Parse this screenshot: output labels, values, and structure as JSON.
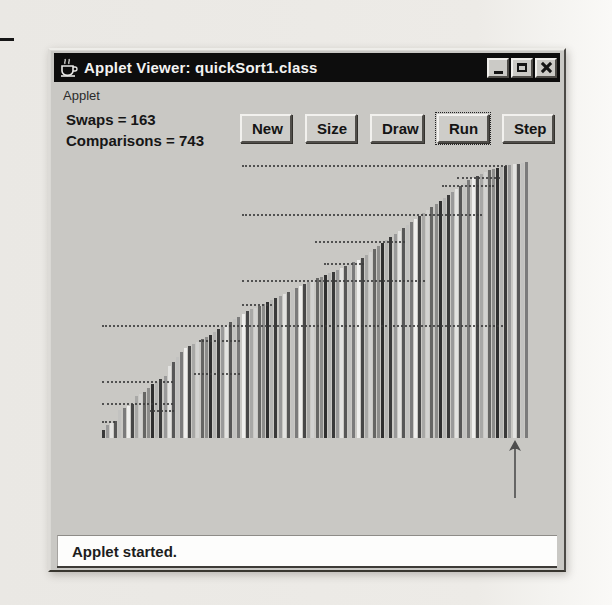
{
  "window": {
    "title": "Applet Viewer: quickSort1.class",
    "menu": {
      "applet_label": "Applet"
    },
    "controls": [
      {
        "name": "minimize"
      },
      {
        "name": "maximize"
      },
      {
        "name": "close"
      }
    ]
  },
  "stats": {
    "swaps": "Swaps = 163",
    "comparisons": "Comparisons = 743"
  },
  "toolbar": {
    "buttons": [
      {
        "label": "New",
        "focused": false
      },
      {
        "label": "Size",
        "focused": false
      },
      {
        "label": "Draw",
        "focused": false
      },
      {
        "label": "Run",
        "focused": true
      },
      {
        "label": "Step",
        "focused": false
      }
    ]
  },
  "status_bar": {
    "text": "Applet started."
  },
  "visualization": {
    "description": "quicksort bar visualization - array values as vertical bars, ascending",
    "bar_heights": [
      8,
      13,
      15,
      17,
      28,
      30,
      32,
      34,
      42,
      44,
      46,
      50,
      54,
      56,
      59,
      62,
      72,
      76,
      81,
      86,
      90,
      92,
      94,
      96,
      99,
      101,
      103,
      106,
      109,
      111,
      113,
      116,
      119,
      121,
      124,
      127,
      129,
      130,
      132,
      134,
      136,
      138,
      140,
      142,
      144,
      146,
      148,
      150,
      152,
      154,
      156,
      158,
      160,
      161,
      163,
      165,
      166,
      168,
      170,
      172,
      174,
      176,
      178,
      180,
      183,
      186,
      189,
      192,
      195,
      198,
      201,
      204,
      207,
      210,
      213,
      216,
      219,
      222,
      225,
      228,
      231,
      234,
      237,
      240,
      243,
      246,
      249,
      252,
      255,
      258,
      260,
      262,
      264,
      266,
      268,
      269,
      270,
      271,
      272,
      273,
      274,
      274,
      275,
      276
    ],
    "bar_palette": [
      "#3a3a3a",
      "#9a9a9a",
      "#e3e3e1",
      "#575757",
      "#c2c2c0",
      "#7b7b7b",
      "#efefed",
      "#474747",
      "#a8a8a6",
      "#d2d2d0",
      "#666664",
      "#8d8d8b",
      "#2f2f2f",
      "#b5b5b3"
    ],
    "pivot_lines": [
      {
        "x1": 140,
        "x2": 405,
        "y": 8
      },
      {
        "x1": 355,
        "x2": 398,
        "y": 20
      },
      {
        "x1": 340,
        "x2": 392,
        "y": 28
      },
      {
        "x1": 140,
        "x2": 380,
        "y": 57
      },
      {
        "x1": 213,
        "x2": 303,
        "y": 84
      },
      {
        "x1": 222,
        "x2": 262,
        "y": 106
      },
      {
        "x1": 140,
        "x2": 323,
        "y": 123
      },
      {
        "x1": 140,
        "x2": 174,
        "y": 147
      },
      {
        "x1": 0,
        "x2": 404,
        "y": 168
      },
      {
        "x1": 97,
        "x2": 138,
        "y": 183
      },
      {
        "x1": 92,
        "x2": 138,
        "y": 216
      },
      {
        "x1": 0,
        "x2": 71,
        "y": 224
      },
      {
        "x1": 0,
        "x2": 71,
        "y": 246
      },
      {
        "x1": 48,
        "x2": 72,
        "y": 253
      },
      {
        "x1": 0,
        "x2": 13,
        "y": 264
      }
    ],
    "pointer": {
      "x": 402,
      "color": "#4d4d4d"
    }
  }
}
